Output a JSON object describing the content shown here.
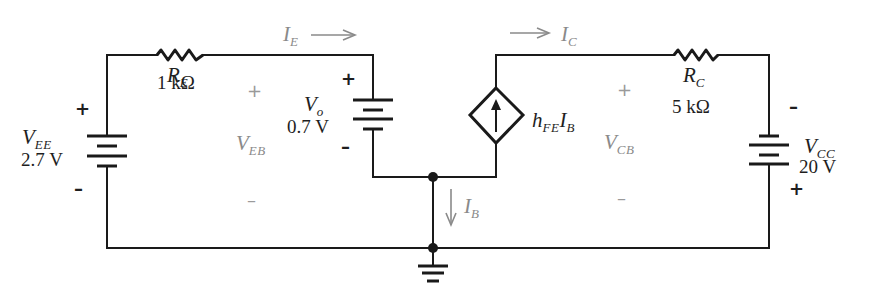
{
  "diagram": {
    "type": "circuit-schematic",
    "components": {
      "V_EE": {
        "symbol": "V",
        "subscript": "EE",
        "value": "2.7 V",
        "plus": "+",
        "minus": "–"
      },
      "R_E": {
        "symbol": "R",
        "subscript": "E",
        "value": "1 kΩ"
      },
      "V_o": {
        "symbol": "V",
        "subscript": "o",
        "value": "0.7 V",
        "plus": "+",
        "minus": "–"
      },
      "source": {
        "symbol": "h",
        "subscript1": "FE",
        "symbol2": "I",
        "subscript2": "B",
        "type": "dependent current source"
      },
      "R_C": {
        "symbol": "R",
        "subscript": "C",
        "value": "5 kΩ"
      },
      "V_CC": {
        "symbol": "V",
        "subscript": "CC",
        "value": "20 V",
        "plus": "+",
        "minus": "–"
      }
    },
    "currents": {
      "I_E": {
        "symbol": "I",
        "subscript": "E",
        "arrow": "→"
      },
      "I_C": {
        "symbol": "I",
        "subscript": "C",
        "arrow": "→"
      },
      "I_B": {
        "symbol": "I",
        "subscript": "B",
        "arrow": "↓"
      }
    },
    "voltages": {
      "V_EB": {
        "symbol": "V",
        "subscript": "EB",
        "plus": "+",
        "minus": "–"
      },
      "V_CB": {
        "symbol": "V",
        "subscript": "CB",
        "plus": "+",
        "minus": "–"
      }
    },
    "colors": {
      "wire": "#1a1a1a",
      "annotation": "#8a8a8a"
    }
  }
}
